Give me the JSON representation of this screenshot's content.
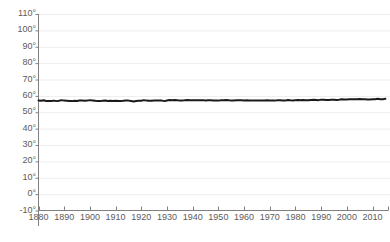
{
  "chart_data": {
    "type": "line",
    "title": "",
    "clipped_top_text": "",
    "xlabel": "",
    "ylabel": "",
    "xlim": [
      1880,
      2016
    ],
    "ylim": [
      -10,
      110
    ],
    "grid": true,
    "legend": false,
    "series_color": "#1a1a1a",
    "grid_color": "#ededed",
    "axis_color": "#808080",
    "tick_label_color": "#5b5b5b",
    "y_ticks": [
      {
        "value": 110,
        "label": "110°"
      },
      {
        "value": 100,
        "label": "100°"
      },
      {
        "value": 90,
        "label": "90°"
      },
      {
        "value": 80,
        "label": "80°"
      },
      {
        "value": 70,
        "label": "70°"
      },
      {
        "value": 60,
        "label": "60°"
      },
      {
        "value": 50,
        "label": "50°"
      },
      {
        "value": 40,
        "label": "40°"
      },
      {
        "value": 30,
        "label": "30°"
      },
      {
        "value": 20,
        "label": "20°"
      },
      {
        "value": 10,
        "label": "10°"
      },
      {
        "value": 0,
        "label": "0°"
      },
      {
        "value": -10,
        "label": "-10°"
      }
    ],
    "x_ticks": [
      {
        "value": 1880,
        "label": "1880"
      },
      {
        "value": 1890,
        "label": "1890"
      },
      {
        "value": 1900,
        "label": "1900"
      },
      {
        "value": 1910,
        "label": "1910"
      },
      {
        "value": 1920,
        "label": "1920"
      },
      {
        "value": 1930,
        "label": "1930"
      },
      {
        "value": 1940,
        "label": "1940"
      },
      {
        "value": 1950,
        "label": "1950"
      },
      {
        "value": 1960,
        "label": "1960"
      },
      {
        "value": 1970,
        "label": "1970"
      },
      {
        "value": 1980,
        "label": "1980"
      },
      {
        "value": 1990,
        "label": "1990"
      },
      {
        "value": 2000,
        "label": "2000"
      },
      {
        "value": 2010,
        "label": "2010"
      }
    ],
    "x": [
      1880,
      1881,
      1882,
      1883,
      1884,
      1885,
      1886,
      1887,
      1888,
      1889,
      1890,
      1891,
      1892,
      1893,
      1894,
      1895,
      1896,
      1897,
      1898,
      1899,
      1900,
      1901,
      1902,
      1903,
      1904,
      1905,
      1906,
      1907,
      1908,
      1909,
      1910,
      1911,
      1912,
      1913,
      1914,
      1915,
      1916,
      1917,
      1918,
      1919,
      1920,
      1921,
      1922,
      1923,
      1924,
      1925,
      1926,
      1927,
      1928,
      1929,
      1930,
      1931,
      1932,
      1933,
      1934,
      1935,
      1936,
      1937,
      1938,
      1939,
      1940,
      1941,
      1942,
      1943,
      1944,
      1945,
      1946,
      1947,
      1948,
      1949,
      1950,
      1951,
      1952,
      1953,
      1954,
      1955,
      1956,
      1957,
      1958,
      1959,
      1960,
      1961,
      1962,
      1963,
      1964,
      1965,
      1966,
      1967,
      1968,
      1969,
      1970,
      1971,
      1972,
      1973,
      1974,
      1975,
      1976,
      1977,
      1978,
      1979,
      1980,
      1981,
      1982,
      1983,
      1984,
      1985,
      1986,
      1987,
      1988,
      1989,
      1990,
      1991,
      1992,
      1993,
      1994,
      1995,
      1996,
      1997,
      1998,
      1999,
      2000,
      2001,
      2002,
      2003,
      2004,
      2005,
      2006,
      2007,
      2008,
      2009,
      2010,
      2011,
      2012,
      2013,
      2014,
      2015
    ],
    "values": [
      57.2,
      57.0,
      57.3,
      56.9,
      56.8,
      56.9,
      57.1,
      56.8,
      57.0,
      57.4,
      57.1,
      57.0,
      56.9,
      56.8,
      57.0,
      56.9,
      57.2,
      57.1,
      57.0,
      57.1,
      57.4,
      57.2,
      57.0,
      56.8,
      56.8,
      57.0,
      57.2,
      56.9,
      57.0,
      56.9,
      57.0,
      56.9,
      56.9,
      57.0,
      57.2,
      57.1,
      56.9,
      56.6,
      56.9,
      57.0,
      57.0,
      57.4,
      57.1,
      57.0,
      57.0,
      57.1,
      57.1,
      57.2,
      57.1,
      56.8,
      57.2,
      57.5,
      57.4,
      57.5,
      57.3,
      57.1,
      57.1,
      57.4,
      57.5,
      57.4,
      57.3,
      57.4,
      57.3,
      57.3,
      57.4,
      57.2,
      57.3,
      57.3,
      57.2,
      57.2,
      57.1,
      57.3,
      57.4,
      57.5,
      57.3,
      57.1,
      57.2,
      57.3,
      57.3,
      57.3,
      57.2,
      57.3,
      57.2,
      57.2,
      57.1,
      57.1,
      57.2,
      57.2,
      57.2,
      57.3,
      57.2,
      57.1,
      57.1,
      57.3,
      57.3,
      57.2,
      57.1,
      57.5,
      57.3,
      57.2,
      57.4,
      57.5,
      57.3,
      57.5,
      57.4,
      57.3,
      57.5,
      57.6,
      57.5,
      57.4,
      57.7,
      57.7,
      57.5,
      57.5,
      57.6,
      57.7,
      57.5,
      57.7,
      58.0,
      57.8,
      57.8,
      57.9,
      58.0,
      57.9,
      57.9,
      58.1,
      58.0,
      58.0,
      57.8,
      57.8,
      58.0,
      58.0,
      58.2,
      57.9,
      58.0,
      58.2
    ],
    "value_unit": "°F",
    "series_name": "Average temperature"
  }
}
